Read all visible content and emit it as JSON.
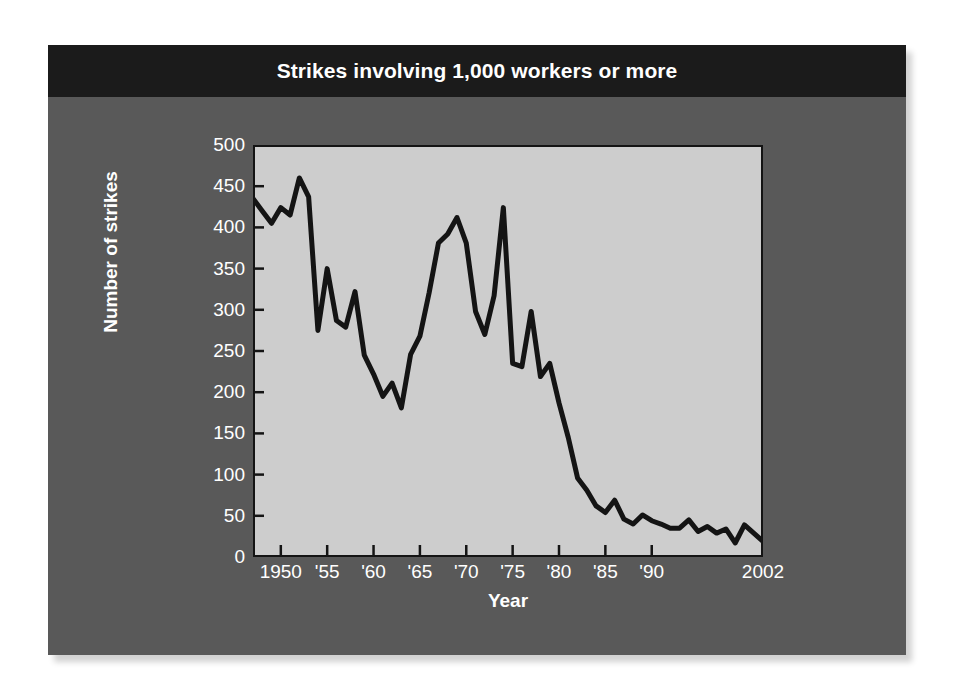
{
  "chart_data": {
    "type": "line",
    "title": "Strikes involving 1,000 workers or more",
    "subtitle": "",
    "xlabel": "Year",
    "ylabel": "Number of strikes",
    "xlim": [
      1947,
      2002
    ],
    "ylim": [
      0,
      500
    ],
    "grid": false,
    "legend": null,
    "y_ticks": [
      500,
      450,
      400,
      350,
      300,
      250,
      200,
      150,
      100,
      50,
      0
    ],
    "x_ticks": [
      {
        "value": 1950,
        "label": "1950"
      },
      {
        "value": 1955,
        "label": "'55"
      },
      {
        "value": 1960,
        "label": "'60"
      },
      {
        "value": 1965,
        "label": "'65"
      },
      {
        "value": 1970,
        "label": "'70"
      },
      {
        "value": 1975,
        "label": "'75"
      },
      {
        "value": 1980,
        "label": "'80"
      },
      {
        "value": 1985,
        "label": "'85"
      },
      {
        "value": 1990,
        "label": "'90"
      },
      {
        "value": 2002,
        "label": "2002"
      }
    ],
    "x": [
      1947,
      1948,
      1949,
      1950,
      1951,
      1952,
      1953,
      1954,
      1955,
      1956,
      1957,
      1958,
      1959,
      1960,
      1961,
      1962,
      1963,
      1964,
      1965,
      1966,
      1967,
      1968,
      1969,
      1970,
      1971,
      1972,
      1973,
      1974,
      1975,
      1976,
      1977,
      1978,
      1979,
      1980,
      1981,
      1982,
      1983,
      1984,
      1985,
      1986,
      1987,
      1988,
      1989,
      1990,
      1991,
      1992,
      1993,
      1994,
      1995,
      1996,
      1997,
      1998,
      1999,
      2000,
      2001,
      2002
    ],
    "values": [
      435,
      420,
      405,
      424,
      415,
      460,
      437,
      275,
      350,
      287,
      279,
      322,
      245,
      222,
      195,
      211,
      181,
      246,
      268,
      321,
      381,
      392,
      412,
      381,
      298,
      270,
      317,
      424,
      235,
      231,
      298,
      219,
      235,
      187,
      145,
      96,
      81,
      62,
      54,
      69,
      46,
      40,
      51,
      44,
      40,
      35,
      35,
      45,
      31,
      37,
      29,
      34,
      17,
      39,
      29,
      19
    ],
    "series": [
      {
        "name": "Strikes involving 1,000 workers or more",
        "color": "#141414",
        "line_width": 5
      }
    ]
  },
  "style": {
    "panel_background": "#595959",
    "title_band_background": "#1b1b1b",
    "plot_background": "#cdcdcd",
    "line_color": "#141414",
    "text_color": "#ffffff",
    "axis_color": "#141414",
    "page_background": "#ffffff"
  }
}
